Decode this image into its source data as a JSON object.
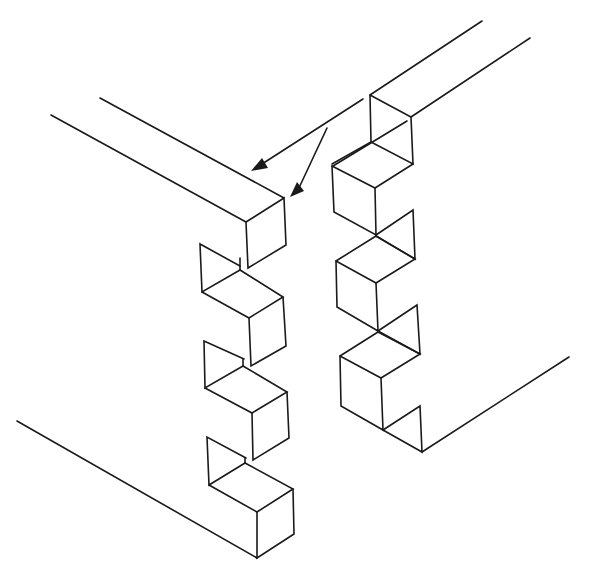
{
  "diagram": {
    "title": "",
    "line_color": "#1a1a1a",
    "background": "#ffffff",
    "parts": [
      {
        "name": "left-board",
        "fingers": 4
      },
      {
        "name": "right-board",
        "fingers": 3
      }
    ],
    "arrows": [
      {
        "name": "assembly-arrow-upper",
        "from": [
          363,
          99
        ],
        "to": [
          252,
          170
        ]
      },
      {
        "name": "assembly-arrow-lower",
        "from": [
          327,
          128
        ],
        "to": [
          290,
          196
        ]
      }
    ],
    "labels": []
  }
}
